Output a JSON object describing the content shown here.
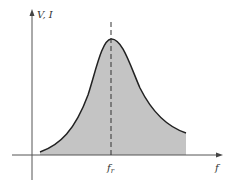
{
  "diagram": {
    "y_axis_label": "V, I",
    "x_axis_label": "f",
    "marker_label_main": "f",
    "marker_label_sub": "r",
    "colors": {
      "fill": "#c4c4c4",
      "curve": "#222222",
      "axes": "#555555",
      "dashed": "#333333"
    }
  }
}
